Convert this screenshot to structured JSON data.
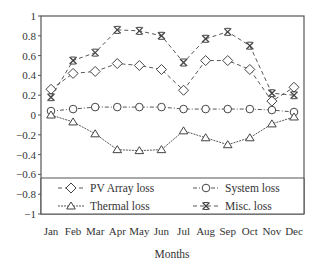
{
  "chart_data": {
    "type": "line",
    "title": "",
    "xlabel": "Months",
    "ylabel": "",
    "ylim": [
      -1,
      1
    ],
    "yticks": [
      1,
      0.8,
      0.6,
      0.4,
      0.2,
      0,
      -0.2,
      -0.4,
      -0.6,
      -0.8,
      -1
    ],
    "ytick_labels": [
      "1",
      "0.8",
      "0.6",
      "0.4",
      "0.2",
      "0",
      "−0.2",
      "−0.4",
      "−0.6",
      "−0.8",
      "−1"
    ],
    "categories": [
      "Jan",
      "Feb",
      "Mar",
      "Apr",
      "May",
      "Jun",
      "Jul",
      "Aug",
      "Sep",
      "Oct",
      "Nov",
      "Dec"
    ],
    "grid": false,
    "legend_position": "inside-bottom",
    "series": [
      {
        "name": "PV Array loss",
        "marker": "diamond",
        "dash": "4,3",
        "values": [
          0.26,
          0.42,
          0.44,
          0.52,
          0.5,
          0.46,
          0.25,
          0.55,
          0.55,
          0.46,
          0.14,
          0.28
        ]
      },
      {
        "name": "System loss",
        "marker": "circle",
        "dash": "4,2,1,2",
        "values": [
          0.04,
          0.06,
          0.08,
          0.08,
          0.08,
          0.08,
          0.06,
          0.06,
          0.06,
          0.06,
          0.05,
          0.03
        ]
      },
      {
        "name": "Thermal loss",
        "marker": "triangle",
        "dash": "2,1",
        "values": [
          0.0,
          -0.07,
          -0.19,
          -0.35,
          -0.36,
          -0.35,
          -0.16,
          -0.23,
          -0.3,
          -0.23,
          -0.09,
          -0.02
        ]
      },
      {
        "name": "Misc. loss",
        "marker": "x",
        "dash": "4,3",
        "values": [
          0.18,
          0.55,
          0.63,
          0.86,
          0.85,
          0.8,
          0.53,
          0.77,
          0.84,
          0.7,
          0.22,
          0.2
        ]
      }
    ]
  },
  "colors": {
    "line": "#444444",
    "axis": "#555555",
    "text": "#333333",
    "background": "#ffffff"
  }
}
